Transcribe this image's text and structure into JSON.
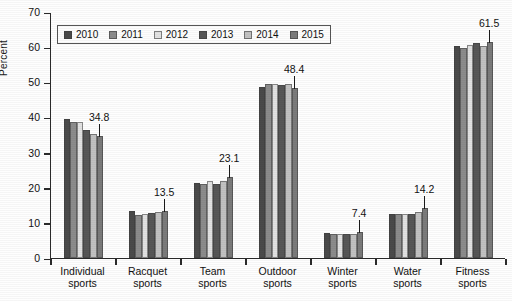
{
  "chart_data": {
    "type": "bar",
    "title": "",
    "xlabel": "",
    "ylabel": "Percent",
    "ylim": [
      0,
      70
    ],
    "yticks": [
      0,
      10,
      20,
      30,
      40,
      50,
      60,
      70
    ],
    "grid": false,
    "legend_position": "top-left-inside",
    "categories": [
      "Individual sports",
      "Racquet sports",
      "Team sports",
      "Outdoor sports",
      "Winter sports",
      "Water sports",
      "Fitness sports"
    ],
    "category_lines": [
      [
        "Individual",
        "sports"
      ],
      [
        "Racquet",
        "sports"
      ],
      [
        "Team",
        "sports"
      ],
      [
        "Outdoor",
        "sports"
      ],
      [
        "Winter",
        "sports"
      ],
      [
        "Water",
        "sports"
      ],
      [
        "Fitness",
        "sports"
      ]
    ],
    "series": [
      {
        "name": "2010",
        "color": "#4a4a4a",
        "values": [
          39.6,
          13.3,
          21.3,
          48.6,
          7.2,
          12.5,
          60.3
        ]
      },
      {
        "name": "2011",
        "color": "#8c8c8c",
        "values": [
          38.7,
          12.3,
          21.2,
          49.5,
          6.9,
          12.4,
          59.8
        ]
      },
      {
        "name": "2012",
        "color": "#e2e2e2",
        "values": [
          38.7,
          12.6,
          22.0,
          49.6,
          6.9,
          12.4,
          60.5
        ]
      },
      {
        "name": "2013",
        "color": "#575757",
        "values": [
          36.3,
          12.9,
          21.2,
          49.2,
          6.9,
          12.5,
          61.2
        ]
      },
      {
        "name": "2014",
        "color": "#c2c2c2",
        "values": [
          35.4,
          13.0,
          21.8,
          49.4,
          6.9,
          13.2,
          60.3
        ]
      },
      {
        "name": "2015",
        "color": "#7b7b7b",
        "values": [
          34.8,
          13.5,
          23.1,
          48.4,
          7.4,
          14.2,
          61.5
        ]
      }
    ],
    "annotations": [
      {
        "category": "Individual sports",
        "series": "2015",
        "value": "34.8"
      },
      {
        "category": "Racquet sports",
        "series": "2015",
        "value": "13.5"
      },
      {
        "category": "Team sports",
        "series": "2015",
        "value": "23.1"
      },
      {
        "category": "Outdoor sports",
        "series": "2015",
        "value": "48.4"
      },
      {
        "category": "Winter sports",
        "series": "2015",
        "value": "7.4"
      },
      {
        "category": "Water sports",
        "series": "2015",
        "value": "14.2"
      },
      {
        "category": "Fitness sports",
        "series": "2015",
        "value": "61.5"
      }
    ]
  }
}
